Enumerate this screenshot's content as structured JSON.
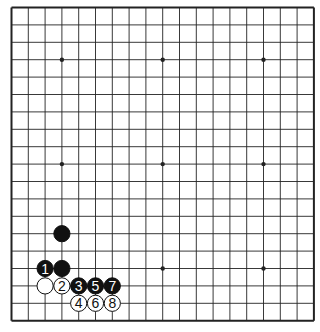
{
  "board": {
    "size": 19,
    "origin": {
      "x": 11.5,
      "y": 7.5
    },
    "spacing": {
      "x": 16.8,
      "y": 17.4
    },
    "line_color": "#222222",
    "border_color": "#222222",
    "background": "#ffffff",
    "star_points": [
      [
        3,
        3
      ],
      [
        9,
        3
      ],
      [
        15,
        3
      ],
      [
        3,
        9
      ],
      [
        9,
        9
      ],
      [
        15,
        9
      ],
      [
        3,
        15
      ],
      [
        9,
        15
      ],
      [
        15,
        15
      ]
    ]
  },
  "stones": [
    {
      "color": "black",
      "x": 3,
      "y": 13,
      "label": ""
    },
    {
      "color": "black",
      "x": 2,
      "y": 15,
      "label": "1"
    },
    {
      "color": "black",
      "x": 3,
      "y": 15,
      "label": ""
    },
    {
      "color": "white",
      "x": 2,
      "y": 16,
      "label": ""
    },
    {
      "color": "white",
      "x": 3,
      "y": 16,
      "label": "2"
    },
    {
      "color": "black",
      "x": 4,
      "y": 16,
      "label": "3"
    },
    {
      "color": "white",
      "x": 4,
      "y": 17,
      "label": "4"
    },
    {
      "color": "black",
      "x": 5,
      "y": 16,
      "label": "5"
    },
    {
      "color": "white",
      "x": 5,
      "y": 17,
      "label": "6"
    },
    {
      "color": "black",
      "x": 6,
      "y": 16,
      "label": "7"
    },
    {
      "color": "white",
      "x": 6,
      "y": 17,
      "label": "8"
    }
  ],
  "colors": {
    "black_stone": "#111111",
    "white_stone": "#ffffff",
    "stone_outline": "#111111"
  }
}
